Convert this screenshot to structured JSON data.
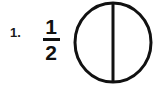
{
  "item": {
    "number_label": "1.",
    "fraction": {
      "numerator": "1",
      "denominator": "2",
      "value_text": "1/2"
    }
  },
  "figure": {
    "shape": "circle",
    "parts_total": 2,
    "parts_shaded": 0,
    "divider_orientation": "vertical",
    "stroke_color": "#111111",
    "fill_color": "#ffffff",
    "stroke_width": 3
  },
  "colors": {
    "background": "#ffffff",
    "ink": "#111111",
    "number_ink": "#1a1a1a"
  }
}
